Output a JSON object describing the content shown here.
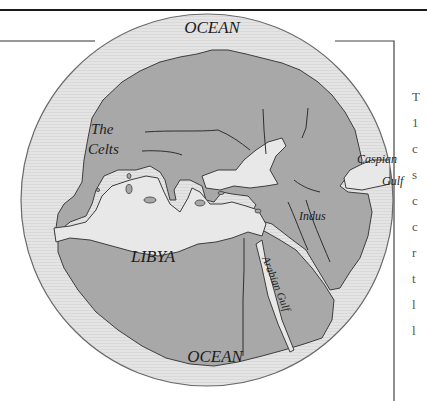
{
  "map": {
    "title": "Herodotus' world map",
    "labels": {
      "ocean_top": "OCEAN",
      "ocean_bottom": "OCEAN",
      "celts_line1": "The",
      "celts_line2": "Celts",
      "libya": "LIBYA",
      "caspian_line1": "Caspian",
      "caspian_line2": "Gulf",
      "indus": "Indus",
      "arabian_gulf": "Arabian Gulf"
    },
    "colors": {
      "ocean": "#e6e6e6",
      "land": "#a9a9a9",
      "sea": "#e9e9e9",
      "outline": "#3c3c3c",
      "frame": "#222222"
    }
  },
  "page": {
    "edge_text_fragments": [
      "T",
      "1",
      "c",
      "s",
      "c",
      "c",
      "r",
      "t",
      "l",
      "l"
    ]
  }
}
